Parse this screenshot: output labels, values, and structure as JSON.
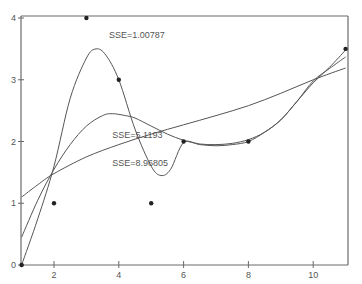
{
  "chart_data": {
    "type": "scatter",
    "title": "",
    "xlabel": "",
    "ylabel": "",
    "xlim": [
      1,
      11.1
    ],
    "ylim": [
      0,
      4
    ],
    "grid": false,
    "x_ticks": [
      2,
      4,
      6,
      8,
      10
    ],
    "y_ticks": [
      0,
      1,
      2,
      3,
      4
    ],
    "points": [
      {
        "x": 1,
        "y": 0
      },
      {
        "x": 2,
        "y": 1
      },
      {
        "x": 3,
        "y": 4
      },
      {
        "x": 4,
        "y": 3
      },
      {
        "x": 5,
        "y": 1
      },
      {
        "x": 6,
        "y": 2
      },
      {
        "x": 8,
        "y": 2
      },
      {
        "x": 11,
        "y": 3.5
      }
    ],
    "series": [
      {
        "name": "SSE=1.00787",
        "type": "line",
        "x": [
          1,
          1.5,
          2,
          2.5,
          3,
          3.3,
          3.6,
          4,
          4.5,
          5,
          5.3,
          5.6,
          6,
          6.5,
          7,
          7.5,
          8,
          8.5,
          9,
          9.5,
          10,
          10.5,
          11
        ],
        "y": [
          0.0,
          0.75,
          1.6,
          2.7,
          3.35,
          3.5,
          3.4,
          3.0,
          2.2,
          1.6,
          1.45,
          1.55,
          1.98,
          1.95,
          1.93,
          1.95,
          2.0,
          2.15,
          2.35,
          2.65,
          2.95,
          3.2,
          3.48
        ]
      },
      {
        "name": "SSE=5.1193",
        "type": "line",
        "x": [
          1,
          1.5,
          2,
          2.5,
          3,
          3.5,
          3.8,
          4.2,
          4.5,
          5,
          5.5,
          6,
          6.5,
          7,
          7.5,
          8,
          8.5,
          9,
          9.5,
          10,
          10.5,
          11
        ],
        "y": [
          0.45,
          1.05,
          1.55,
          1.95,
          2.25,
          2.42,
          2.45,
          2.42,
          2.38,
          2.25,
          2.12,
          2.02,
          1.96,
          1.95,
          1.97,
          2.03,
          2.15,
          2.35,
          2.65,
          2.98,
          3.18,
          3.37
        ]
      },
      {
        "name": "SSE=8.96805",
        "type": "line",
        "x": [
          1,
          1.5,
          2,
          3,
          4,
          5,
          6,
          7,
          8,
          9,
          10,
          11
        ],
        "y": [
          1.1,
          1.3,
          1.48,
          1.75,
          1.95,
          2.12,
          2.27,
          2.42,
          2.58,
          2.78,
          3.0,
          3.19
        ]
      }
    ],
    "annotations": [
      {
        "text": "SSE=1.00787",
        "x": 3.7,
        "y": 3.68
      },
      {
        "text": "SSE=5.1193",
        "x": 3.8,
        "y": 2.05
      },
      {
        "text": "SSE=8.96805",
        "x": 3.8,
        "y": 1.6
      }
    ]
  }
}
